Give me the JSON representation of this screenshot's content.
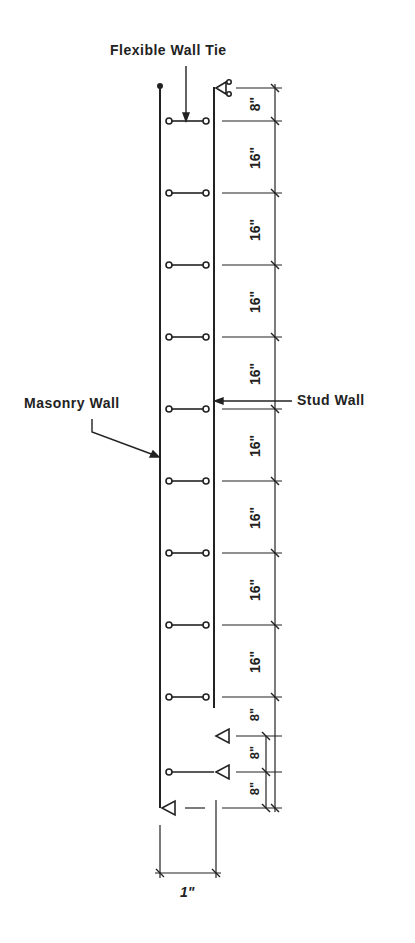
{
  "diagram": {
    "labels": {
      "tie": "Flexible Wall Tie",
      "masonry": "Masonry Wall",
      "stud": "Stud Wall",
      "gap": "1\""
    },
    "dimensions": [
      "8\"",
      "16\"",
      "16\"",
      "16\"",
      "16\"",
      "16\"",
      "16\"",
      "16\"",
      "16\"",
      "8\"",
      "8\"",
      "8\""
    ],
    "colors": {
      "ink": "#222222",
      "paper": "#ffffff"
    }
  }
}
